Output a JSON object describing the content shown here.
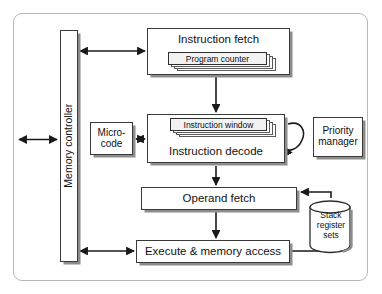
{
  "diagram": {
    "frame": {
      "name": "outer-frame"
    },
    "blocks": {
      "memory_controller": "Memory controller",
      "instruction_fetch": "Instruction fetch",
      "program_counter": "Program counter",
      "instruction_window": "Instruction window",
      "instruction_decode": "Instruction decode",
      "micro_code_line1": "Micro-",
      "micro_code_line2": "code",
      "priority_manager_line1": "Priority",
      "priority_manager_line2": "manager",
      "operand_fetch": "Operand fetch",
      "execute_memory_access": "Execute & memory access",
      "stack_register_line1": "Stack",
      "stack_register_line2": "register",
      "stack_register_line3": "sets"
    },
    "connections": [
      "external-bus <-> memory-controller",
      "memory-controller <-> instruction-fetch",
      "instruction-fetch -> instruction-decode",
      "micro-code <-> instruction-decode",
      "instruction-decode -> priority-manager (loop)",
      "instruction-decode -> operand-fetch",
      "stack-register-sets -> operand-fetch",
      "operand-fetch -> execute-memory-access",
      "memory-controller <-> execute-memory-access",
      "execute-memory-access -> stack-register-sets"
    ],
    "colors": {
      "line": "#1a1a1a",
      "shadow": "#8d8d8d",
      "frame_border": "#b8b8b8",
      "box_fill": "#ffffff",
      "inner_card_fill": "#f2f2f2"
    }
  }
}
